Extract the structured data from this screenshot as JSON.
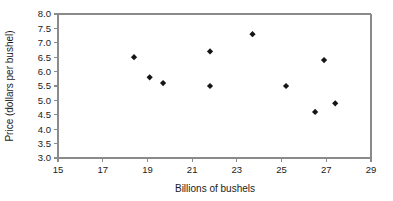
{
  "chart_data": {
    "type": "scatter",
    "title": "",
    "xlabel": "Billions of bushels",
    "ylabel": "Price (dollars per bushel)",
    "xlim": [
      15,
      29
    ],
    "ylim": [
      3.0,
      8.0
    ],
    "xticks": [
      "15",
      "17",
      "19",
      "21",
      "23",
      "25",
      "27",
      "29"
    ],
    "xtick_values": [
      15,
      17,
      19,
      21,
      23,
      25,
      27,
      29
    ],
    "yticks": [
      "3.0",
      "3.5",
      "4.0",
      "4.5",
      "5.0",
      "5.5",
      "6.0",
      "6.5",
      "7.0",
      "7.5",
      "8.0"
    ],
    "ytick_values": [
      3.0,
      3.5,
      4.0,
      4.5,
      5.0,
      5.5,
      6.0,
      6.5,
      7.0,
      7.5,
      8.0
    ],
    "grid": false,
    "legend": null,
    "marker": "diamond",
    "marker_color": "#151515",
    "series": [
      {
        "name": "Corn price vs. production",
        "points": [
          {
            "x": 18.4,
            "y": 6.5
          },
          {
            "x": 19.1,
            "y": 5.8
          },
          {
            "x": 19.7,
            "y": 5.6
          },
          {
            "x": 21.8,
            "y": 6.7
          },
          {
            "x": 21.8,
            "y": 5.5
          },
          {
            "x": 23.7,
            "y": 7.3
          },
          {
            "x": 25.2,
            "y": 5.5
          },
          {
            "x": 26.5,
            "y": 4.6
          },
          {
            "x": 26.9,
            "y": 6.4
          },
          {
            "x": 27.4,
            "y": 4.9
          }
        ]
      }
    ]
  },
  "colors": {
    "axis": "#8a8a8a",
    "text": "#1a1a1a",
    "marker": "#151515",
    "background": "#ffffff"
  }
}
